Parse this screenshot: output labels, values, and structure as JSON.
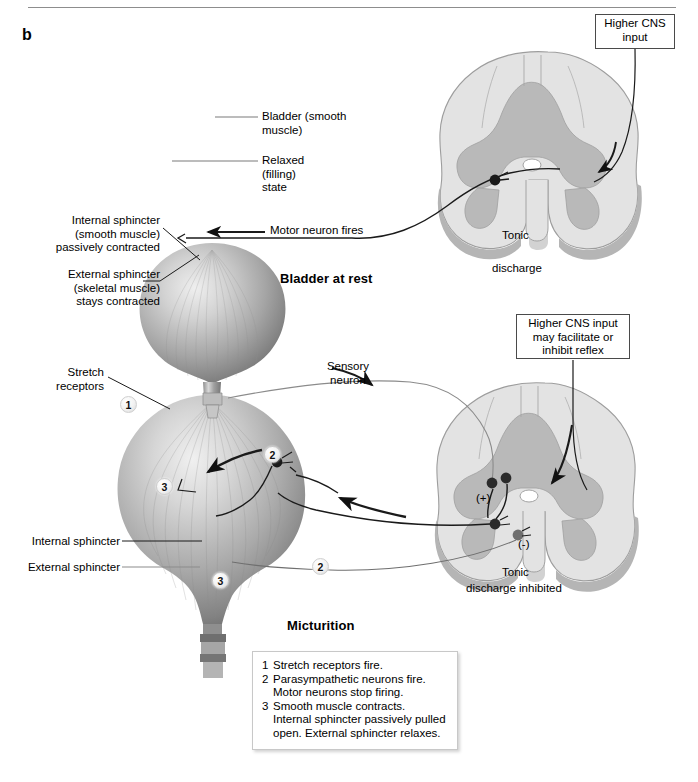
{
  "panel": {
    "letter": "b"
  },
  "colors": {
    "cord_outer": "#e3e3e3",
    "cord_gray_matter": "#b9b9b9",
    "cord_edge": "#9a9a9a",
    "bladder_light": "#e8e8e8",
    "bladder_mid": "#a8a8a8",
    "bladder_dark": "#6e6e6e",
    "line": "#1a1a1a",
    "leader": "#6b6b6b",
    "box_border": "#4a4a4a"
  },
  "top_panel": {
    "title": "Bladder at rest",
    "labels": {
      "bladder_smooth_muscle": "Bladder (smooth\nmuscle)",
      "relaxed_filling_state": "Relaxed\n(filling)\nstate",
      "internal_sphincter": "Internal sphincter\n(smooth muscle)\npassively contracted",
      "external_sphincter": "External sphincter\n(skeletal muscle)\nstays contracted",
      "motor_neuron_fires": "Motor neuron fires",
      "tonic": "Tonic",
      "discharge": "discharge"
    },
    "cns_box": "Higher CNS\ninput"
  },
  "bottom_panel": {
    "title": "Micturition",
    "labels": {
      "stretch_receptors": "Stretch\nreceptors",
      "sensory_neuron": "Sensory\nneuron",
      "internal_sphincter": "Internal sphincter",
      "external_sphincter": "External sphincter",
      "tonic": "Tonic",
      "discharge_inhibited": "discharge inhibited",
      "plus_sign": "(+)",
      "minus_sign": "(-)"
    },
    "cns_box": "Higher CNS input\nmay facilitate or\ninhibit reflex",
    "badges": [
      {
        "id": "badge-1-stretch",
        "label": "1"
      },
      {
        "id": "badge-3-muscle",
        "label": "3"
      },
      {
        "id": "badge-2-upper",
        "label": "2"
      },
      {
        "id": "badge-2-lower",
        "label": "2"
      },
      {
        "id": "badge-3-sphincter",
        "label": "3"
      }
    ]
  },
  "legend": {
    "items": [
      {
        "num": "1",
        "text": "Stretch receptors fire.",
        "continuation": []
      },
      {
        "num": "2",
        "text": "Parasympathetic neurons fire.",
        "continuation": [
          "Motor neurons stop firing."
        ]
      },
      {
        "num": "3",
        "text": "Smooth muscle contracts.",
        "continuation": [
          "Internal sphincter passively pulled",
          "open. External sphincter relaxes."
        ]
      }
    ]
  }
}
